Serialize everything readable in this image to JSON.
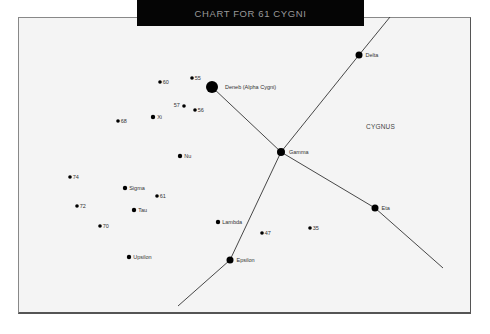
{
  "title": "CHART FOR 61 CYGNI",
  "constellation_label": "CYGNUS",
  "colors": {
    "title_bg": "#050505",
    "title_text": "#9a9a9a",
    "background": "#f4f4f4",
    "star": "#000000",
    "line": "#333333"
  },
  "stars": [
    {
      "name": "Deneb (Alpha Cygni)",
      "x": 212,
      "y": 87,
      "r": 6,
      "label_dx": 9,
      "label_dy": -3
    },
    {
      "name": "Delta",
      "x": 359,
      "y": 55,
      "r": 3.5,
      "label_dx": 5,
      "label_dy": -3
    },
    {
      "name": "Gamma",
      "x": 281,
      "y": 152,
      "r": 4,
      "label_dx": 6,
      "label_dy": -3
    },
    {
      "name": "Eta",
      "x": 375,
      "y": 208,
      "r": 3.5,
      "label_dx": 5,
      "label_dy": -3
    },
    {
      "name": "Epsilon",
      "x": 230,
      "y": 260,
      "r": 3.5,
      "label_dx": 5,
      "label_dy": -3
    },
    {
      "name": "60",
      "x": 160,
      "y": 82,
      "r": 1.8,
      "label_dx": 3,
      "label_dy": -3
    },
    {
      "name": "55",
      "x": 192,
      "y": 78,
      "r": 1.8,
      "label_dx": 3,
      "label_dy": -3
    },
    {
      "name": "57",
      "x": 184,
      "y": 106,
      "r": 1.8,
      "label_dx": -10,
      "label_dy": -4
    },
    {
      "name": "56",
      "x": 195,
      "y": 110,
      "r": 1.8,
      "label_dx": 3,
      "label_dy": -3
    },
    {
      "name": "Xi",
      "x": 153,
      "y": 117,
      "r": 2.2,
      "label_dx": 4,
      "label_dy": -3
    },
    {
      "name": "68",
      "x": 118,
      "y": 121,
      "r": 1.8,
      "label_dx": 3,
      "label_dy": -3
    },
    {
      "name": "Nu",
      "x": 180,
      "y": 156,
      "r": 2.2,
      "label_dx": 4,
      "label_dy": -3
    },
    {
      "name": "74",
      "x": 70,
      "y": 177,
      "r": 1.8,
      "label_dx": 3,
      "label_dy": -3
    },
    {
      "name": "Sigma",
      "x": 125,
      "y": 188,
      "r": 2.2,
      "label_dx": 4,
      "label_dy": -3
    },
    {
      "name": "61",
      "x": 157,
      "y": 196,
      "r": 1.8,
      "label_dx": 3,
      "label_dy": -3
    },
    {
      "name": "72",
      "x": 77,
      "y": 206,
      "r": 1.8,
      "label_dx": 3,
      "label_dy": -3
    },
    {
      "name": "Tau",
      "x": 134,
      "y": 210,
      "r": 2.2,
      "label_dx": 4,
      "label_dy": -3
    },
    {
      "name": "70",
      "x": 100,
      "y": 226,
      "r": 1.8,
      "label_dx": 3,
      "label_dy": -3
    },
    {
      "name": "Lambda",
      "x": 218,
      "y": 222,
      "r": 2.2,
      "label_dx": 4,
      "label_dy": -3
    },
    {
      "name": "47",
      "x": 262,
      "y": 233,
      "r": 1.8,
      "label_dx": 3,
      "label_dy": -3
    },
    {
      "name": "35",
      "x": 310,
      "y": 228,
      "r": 1.8,
      "label_dx": 3,
      "label_dy": -3
    },
    {
      "name": "Upsilon",
      "x": 129,
      "y": 257,
      "r": 2.2,
      "label_dx": 4,
      "label_dy": -3
    }
  ],
  "lines": [
    {
      "x1": 212,
      "y1": 87,
      "x2": 281,
      "y2": 152
    },
    {
      "x1": 281,
      "y1": 152,
      "x2": 359,
      "y2": 55
    },
    {
      "x1": 359,
      "y1": 55,
      "x2": 390,
      "y2": 17
    },
    {
      "x1": 281,
      "y1": 152,
      "x2": 375,
      "y2": 208
    },
    {
      "x1": 375,
      "y1": 208,
      "x2": 443,
      "y2": 268
    },
    {
      "x1": 281,
      "y1": 152,
      "x2": 230,
      "y2": 260
    },
    {
      "x1": 230,
      "y1": 260,
      "x2": 178,
      "y2": 306
    }
  ],
  "constellation_label_pos": {
    "x": 366,
    "y": 123
  }
}
